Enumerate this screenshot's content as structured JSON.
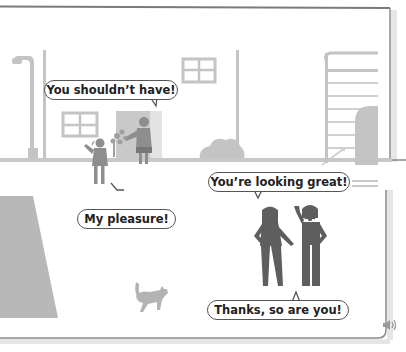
{
  "scene": {
    "colors": {
      "frame": "#7a7a7a",
      "building_gray": "#c4c4c4",
      "figure_dark": "#5e5e5e",
      "figure_light": "#a9a9a9",
      "ground_gray": "#b5b5b5",
      "bubble_border": "#555555"
    },
    "bubbles": [
      {
        "id": "you-shouldnt-have",
        "text": "You shouldn’t have!"
      },
      {
        "id": "my-pleasure",
        "text": "My pleasure!"
      },
      {
        "id": "youre-looking-great",
        "text": "You’re looking great!"
      },
      {
        "id": "thanks-so-are-you",
        "text": "Thanks, so are you!"
      }
    ],
    "audio_icon": "speaker-icon"
  }
}
